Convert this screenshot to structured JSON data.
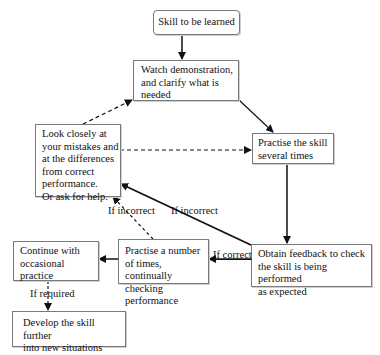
{
  "diagram": {
    "nodes": {
      "skill": "Skill to be learned",
      "watch": "Watch demonstration,\nand clarify what is\nneeded",
      "look": "Look closely at\nyour mistakes and\nat the differences\nfrom correct\nperformance.\nOr ask for help.",
      "practise_skill": "Practise the skill\nseveral times",
      "feedback": "Obtain feedback to check\nthe skill is being performed\nas expected",
      "practise_number": "Practise a number\nof times, continually\nchecking performance",
      "continue": "Continue with\noccasional practice",
      "develop": "Develop the skill further\ninto new situations"
    },
    "labels": {
      "if_incorrect_dashed": "If incorrect",
      "if_incorrect_solid": "If incorrect",
      "if_correct": "If correct",
      "if_required": "If required"
    },
    "edges": [
      {
        "from": "skill",
        "to": "watch",
        "style": "solid"
      },
      {
        "from": "watch",
        "to": "practise_skill",
        "style": "solid"
      },
      {
        "from": "look",
        "to": "watch",
        "style": "dashed"
      },
      {
        "from": "look",
        "to": "practise_skill",
        "style": "dashed"
      },
      {
        "from": "practise_skill",
        "to": "feedback",
        "style": "solid"
      },
      {
        "from": "feedback",
        "to": "look",
        "style": "solid",
        "label": "If incorrect"
      },
      {
        "from": "feedback",
        "to": "practise_number",
        "style": "solid",
        "label": "If correct"
      },
      {
        "from": "practise_number",
        "to": "look",
        "style": "dashed",
        "label": "If incorrect"
      },
      {
        "from": "practise_number",
        "to": "continue",
        "style": "solid"
      },
      {
        "from": "continue",
        "to": "develop",
        "style": "dashed",
        "label": "If required"
      }
    ]
  }
}
